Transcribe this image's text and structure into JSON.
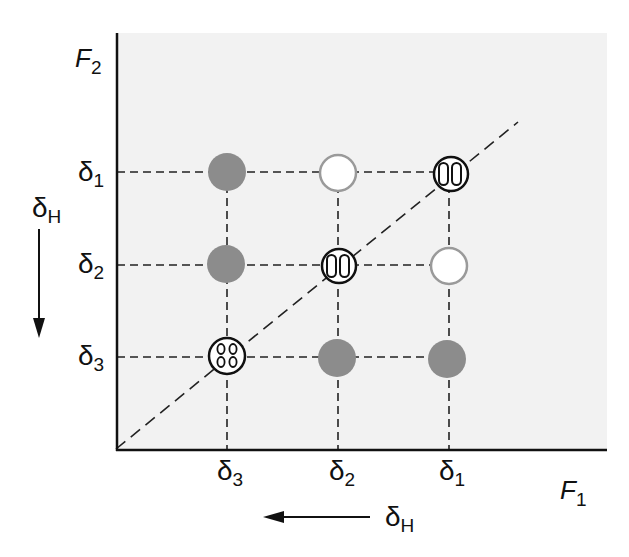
{
  "diagram": {
    "y_axis_label": "F",
    "y_axis_label_sub": "2",
    "x_axis_label": "F",
    "x_axis_label_sub": "1",
    "delta_symbol": "δ",
    "y_ticks": [
      {
        "label": "δ",
        "sub": "1"
      },
      {
        "label": "δ",
        "sub": "2"
      },
      {
        "label": "δ",
        "sub": "3"
      }
    ],
    "x_ticks": [
      {
        "label": "δ",
        "sub": "3"
      },
      {
        "label": "δ",
        "sub": "2"
      },
      {
        "label": "δ",
        "sub": "1"
      }
    ],
    "left_arrow": {
      "label": "δ",
      "sub": "H",
      "direction": "down"
    },
    "bottom_arrow": {
      "label": "δ",
      "sub": "H",
      "direction": "left"
    },
    "colors": {
      "background_panel": "#f2f2f2",
      "filled_circle": "#8c8c8c",
      "open_circle_stroke": "#9a9a9a",
      "ink": "#111111"
    },
    "grid": {
      "columns": [
        "δ3",
        "δ2",
        "δ1"
      ],
      "rows": [
        "δ1",
        "δ2",
        "δ3"
      ],
      "cells": [
        [
          "filled",
          "open",
          "two-lobed"
        ],
        [
          "filled",
          "two-lobed",
          "open"
        ],
        [
          "four-lobed",
          "filled",
          "filled"
        ]
      ]
    },
    "diagonal": "dashed line F1 = F2 from origin"
  }
}
